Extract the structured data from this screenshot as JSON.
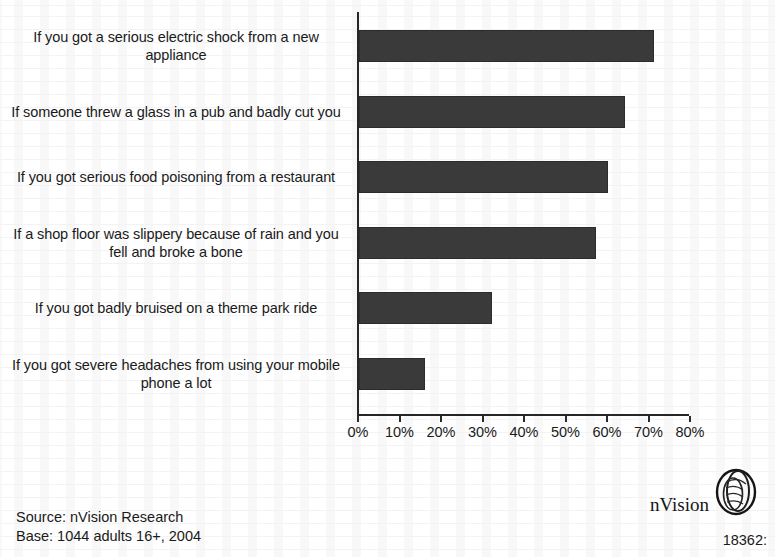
{
  "chart_data": {
    "type": "bar",
    "orientation": "horizontal",
    "title": "",
    "subtitle": "",
    "xlabel": "",
    "ylabel": "",
    "xlim": [
      0,
      80
    ],
    "xtick_step": 10,
    "grid": false,
    "legend": null,
    "value_suffix": "%",
    "bar_color": "#3a3a3a",
    "axis_color": "#262626",
    "categories": [
      "If you got a serious electric shock from a new appliance",
      "If someone threw a glass in a pub and badly cut you",
      "If you got serious food poisoning from a restaurant",
      "If a shop floor was slippery because of rain and you fell and broke a bone",
      "If you got badly bruised on a theme park ride",
      "If you got severe headaches from using your mobile phone a lot"
    ],
    "values": [
      71,
      64,
      60,
      57,
      32,
      16
    ],
    "tick_labels": [
      "0%",
      "10%",
      "20%",
      "30%",
      "40%",
      "50%",
      "60%",
      "70%",
      "80%"
    ],
    "tick_values": [
      0,
      10,
      20,
      30,
      40,
      50,
      60,
      70,
      80
    ]
  },
  "footer": {
    "source": "Source: nVision Research",
    "base": "Base: 1044 adults 16+, 2004"
  },
  "logo": {
    "text": "nVision",
    "mark_name": "nvision-eye-icon"
  },
  "document_number": "18362:"
}
